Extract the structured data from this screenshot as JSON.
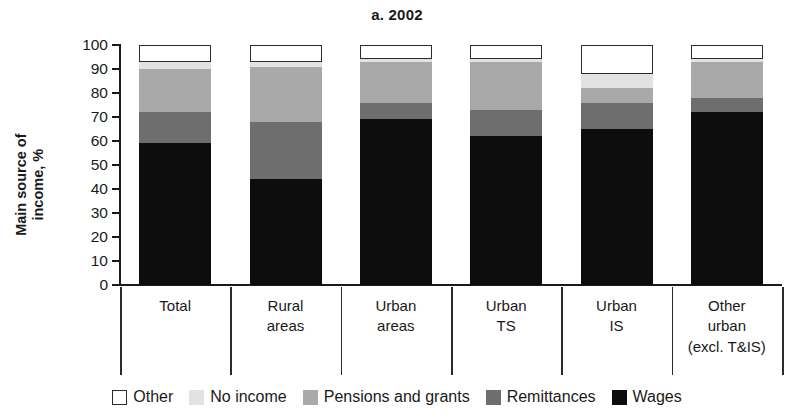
{
  "chart_data": {
    "type": "bar",
    "stacked": true,
    "title": "a. 2002",
    "xlabel": "",
    "ylabel": "Main source of income, %",
    "ylabel_line1": "Main source of",
    "ylabel_line2": "income, %",
    "ylim": [
      0,
      100
    ],
    "ytick_step": 10,
    "yticks": [
      100,
      90,
      80,
      70,
      60,
      50,
      40,
      30,
      20,
      10,
      0
    ],
    "grid": false,
    "legend_position": "bottom",
    "categories": [
      "Total",
      "Rural areas",
      "Urban areas",
      "Urban TS",
      "Urban IS",
      "Other urban (excl. T&IS)"
    ],
    "category_lines": [
      [
        "Total"
      ],
      [
        "Rural",
        "areas"
      ],
      [
        "Urban",
        "areas"
      ],
      [
        "Urban",
        "TS"
      ],
      [
        "Urban",
        "IS"
      ],
      [
        "Other",
        "urban",
        "(excl. T&IS)"
      ]
    ],
    "series": [
      {
        "name": "Wages",
        "color": "#0d0d0d",
        "values": [
          59,
          44,
          69,
          62,
          65,
          72
        ]
      },
      {
        "name": "Remittances",
        "color": "#6e6e6e",
        "values": [
          13,
          24,
          7,
          11,
          11,
          6
        ]
      },
      {
        "name": "Pensions and grants",
        "color": "#a9a9a9",
        "values": [
          18,
          23,
          17,
          20,
          6,
          15
        ]
      },
      {
        "name": "No income",
        "color": "#e2e2e2",
        "values": [
          3,
          2,
          1,
          1,
          6,
          1
        ]
      },
      {
        "name": "Other",
        "color": "#ffffff",
        "values": [
          7,
          7,
          6,
          6,
          12,
          6
        ]
      }
    ],
    "legend": [
      {
        "label": "Other",
        "swatch": "sw-other"
      },
      {
        "label": "No income",
        "swatch": "sw-noincome"
      },
      {
        "label": "Pensions and grants",
        "swatch": "sw-pensions"
      },
      {
        "label": "Remittances",
        "swatch": "sw-remittances"
      },
      {
        "label": "Wages",
        "swatch": "sw-wages"
      }
    ]
  }
}
